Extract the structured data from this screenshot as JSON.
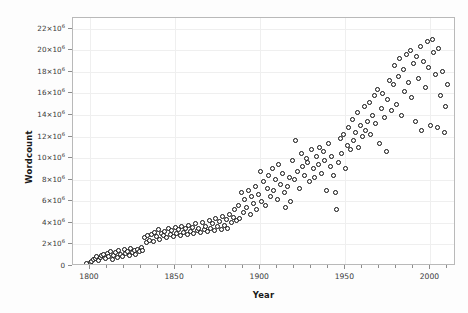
{
  "chart_data": {
    "type": "scatter",
    "title": "",
    "xlabel": "Year",
    "ylabel": "Wordcount",
    "xlim": [
      1790,
      2015
    ],
    "ylim": [
      0,
      23000000
    ],
    "grid": true,
    "legend": false,
    "marker": {
      "shape": "circle",
      "fill": "#ffffff",
      "stroke": "#0d0d0d",
      "size_px": 5
    },
    "xticks": [
      1800,
      1850,
      1900,
      1950,
      2000
    ],
    "xtick_labels": [
      "1800",
      "1850",
      "1900",
      "1950",
      "2000"
    ],
    "x_minor_tick_step": 10,
    "yticks": [
      0,
      2000000,
      4000000,
      6000000,
      8000000,
      10000000,
      12000000,
      14000000,
      16000000,
      18000000,
      20000000,
      22000000
    ],
    "ytick_labels": [
      "0",
      "2×10⁶",
      "4×10⁶",
      "6×10⁶",
      "8×10⁶",
      "10×10⁶",
      "12×10⁶",
      "14×10⁶",
      "16×10⁶",
      "18×10⁶",
      "20×10⁶",
      "22×10⁶"
    ],
    "ytick_mantissa": [
      "0",
      "2",
      "4",
      "6",
      "8",
      "10",
      "12",
      "14",
      "16",
      "18",
      "20",
      "22"
    ],
    "ytick_exponent": "6",
    "points": [
      [
        1798,
        250000
      ],
      [
        1800,
        300000
      ],
      [
        1801,
        450000
      ],
      [
        1802,
        600000
      ],
      [
        1803,
        700000
      ],
      [
        1804,
        900000
      ],
      [
        1805,
        500000
      ],
      [
        1806,
        800000
      ],
      [
        1807,
        1000000
      ],
      [
        1808,
        1100000
      ],
      [
        1809,
        700000
      ],
      [
        1810,
        1200000
      ],
      [
        1811,
        900000
      ],
      [
        1812,
        1300000
      ],
      [
        1813,
        600000
      ],
      [
        1814,
        1000000
      ],
      [
        1815,
        1250000
      ],
      [
        1816,
        800000
      ],
      [
        1817,
        1400000
      ],
      [
        1818,
        1050000
      ],
      [
        1819,
        900000
      ],
      [
        1820,
        1500000
      ],
      [
        1821,
        1200000
      ],
      [
        1822,
        1350000
      ],
      [
        1823,
        1000000
      ],
      [
        1824,
        1600000
      ],
      [
        1825,
        1250000
      ],
      [
        1826,
        1450000
      ],
      [
        1827,
        1100000
      ],
      [
        1828,
        1550000
      ],
      [
        1829,
        1300000
      ],
      [
        1830,
        1700000
      ],
      [
        1831,
        1400000
      ],
      [
        1832,
        2600000
      ],
      [
        1833,
        2200000
      ],
      [
        1834,
        2800000
      ],
      [
        1835,
        2400000
      ],
      [
        1836,
        2900000
      ],
      [
        1837,
        2300000
      ],
      [
        1838,
        3100000
      ],
      [
        1839,
        2700000
      ],
      [
        1840,
        3400000
      ],
      [
        1841,
        2500000
      ],
      [
        1842,
        3000000
      ],
      [
        1843,
        2800000
      ],
      [
        1844,
        3200000
      ],
      [
        1845,
        2600000
      ],
      [
        1846,
        3500000
      ],
      [
        1847,
        2900000
      ],
      [
        1848,
        3300000
      ],
      [
        1849,
        2700000
      ],
      [
        1850,
        3600000
      ],
      [
        1851,
        3000000
      ],
      [
        1852,
        3400000
      ],
      [
        1853,
        2800000
      ],
      [
        1854,
        3700000
      ],
      [
        1855,
        3100000
      ],
      [
        1856,
        3500000
      ],
      [
        1857,
        2900000
      ],
      [
        1858,
        3800000
      ],
      [
        1859,
        3200000
      ],
      [
        1860,
        3600000
      ],
      [
        1861,
        3000000
      ],
      [
        1862,
        3900000
      ],
      [
        1863,
        3300000
      ],
      [
        1864,
        3500000
      ],
      [
        1865,
        3100000
      ],
      [
        1866,
        4000000
      ],
      [
        1867,
        3400000
      ],
      [
        1868,
        3700000
      ],
      [
        1869,
        3200000
      ],
      [
        1870,
        4200000
      ],
      [
        1871,
        3500000
      ],
      [
        1872,
        3900000
      ],
      [
        1873,
        3300000
      ],
      [
        1874,
        4400000
      ],
      [
        1875,
        3700000
      ],
      [
        1876,
        4100000
      ],
      [
        1877,
        3400000
      ],
      [
        1878,
        4600000
      ],
      [
        1879,
        3800000
      ],
      [
        1880,
        4300000
      ],
      [
        1881,
        3500000
      ],
      [
        1882,
        4800000
      ],
      [
        1883,
        4000000
      ],
      [
        1884,
        4500000
      ],
      [
        1885,
        5200000
      ],
      [
        1886,
        4200000
      ],
      [
        1887,
        5600000
      ],
      [
        1888,
        4400000
      ],
      [
        1889,
        6800000
      ],
      [
        1890,
        5000000
      ],
      [
        1891,
        6200000
      ],
      [
        1892,
        5400000
      ],
      [
        1893,
        7000000
      ],
      [
        1894,
        4800000
      ],
      [
        1895,
        6400000
      ],
      [
        1896,
        5800000
      ],
      [
        1897,
        7400000
      ],
      [
        1898,
        5200000
      ],
      [
        1899,
        6600000
      ],
      [
        1900,
        8800000
      ],
      [
        1901,
        6000000
      ],
      [
        1902,
        7800000
      ],
      [
        1903,
        5600000
      ],
      [
        1904,
        7200000
      ],
      [
        1905,
        8400000
      ],
      [
        1906,
        6400000
      ],
      [
        1907,
        9000000
      ],
      [
        1908,
        7000000
      ],
      [
        1909,
        8000000
      ],
      [
        1910,
        6200000
      ],
      [
        1911,
        9400000
      ],
      [
        1912,
        7600000
      ],
      [
        1913,
        8600000
      ],
      [
        1914,
        6800000
      ],
      [
        1915,
        5400000
      ],
      [
        1916,
        7400000
      ],
      [
        1917,
        8200000
      ],
      [
        1918,
        6000000
      ],
      [
        1919,
        9800000
      ],
      [
        1920,
        8000000
      ],
      [
        1921,
        11600000
      ],
      [
        1922,
        8800000
      ],
      [
        1923,
        7200000
      ],
      [
        1924,
        10400000
      ],
      [
        1925,
        9200000
      ],
      [
        1926,
        8400000
      ],
      [
        1927,
        10000000
      ],
      [
        1928,
        9600000
      ],
      [
        1929,
        7800000
      ],
      [
        1930,
        10800000
      ],
      [
        1931,
        9000000
      ],
      [
        1932,
        8200000
      ],
      [
        1933,
        10200000
      ],
      [
        1934,
        9400000
      ],
      [
        1935,
        11000000
      ],
      [
        1936,
        8600000
      ],
      [
        1937,
        10600000
      ],
      [
        1938,
        9800000
      ],
      [
        1939,
        7000000
      ],
      [
        1940,
        11400000
      ],
      [
        1941,
        9200000
      ],
      [
        1942,
        10200000
      ],
      [
        1943,
        8400000
      ],
      [
        1944,
        6800000
      ],
      [
        1945,
        5200000
      ],
      [
        1946,
        9600000
      ],
      [
        1947,
        11800000
      ],
      [
        1948,
        10400000
      ],
      [
        1949,
        12200000
      ],
      [
        1950,
        9000000
      ],
      [
        1951,
        11200000
      ],
      [
        1952,
        12800000
      ],
      [
        1953,
        10800000
      ],
      [
        1954,
        13600000
      ],
      [
        1955,
        11600000
      ],
      [
        1956,
        12400000
      ],
      [
        1957,
        14200000
      ],
      [
        1958,
        11000000
      ],
      [
        1959,
        13000000
      ],
      [
        1960,
        12000000
      ],
      [
        1961,
        14800000
      ],
      [
        1962,
        12600000
      ],
      [
        1963,
        13400000
      ],
      [
        1964,
        15200000
      ],
      [
        1965,
        12200000
      ],
      [
        1966,
        14000000
      ],
      [
        1967,
        15800000
      ],
      [
        1968,
        13200000
      ],
      [
        1969,
        16400000
      ],
      [
        1970,
        11400000
      ],
      [
        1971,
        14600000
      ],
      [
        1972,
        16000000
      ],
      [
        1973,
        13800000
      ],
      [
        1974,
        10600000
      ],
      [
        1975,
        15400000
      ],
      [
        1976,
        17200000
      ],
      [
        1977,
        14400000
      ],
      [
        1978,
        16800000
      ],
      [
        1979,
        18600000
      ],
      [
        1980,
        15000000
      ],
      [
        1981,
        17600000
      ],
      [
        1982,
        19200000
      ],
      [
        1983,
        14000000
      ],
      [
        1984,
        18200000
      ],
      [
        1985,
        16200000
      ],
      [
        1986,
        19600000
      ],
      [
        1987,
        17000000
      ],
      [
        1988,
        20000000
      ],
      [
        1989,
        15600000
      ],
      [
        1990,
        18800000
      ],
      [
        1991,
        13400000
      ],
      [
        1992,
        19400000
      ],
      [
        1993,
        17400000
      ],
      [
        1994,
        20400000
      ],
      [
        1995,
        12600000
      ],
      [
        1996,
        19000000
      ],
      [
        1997,
        16600000
      ],
      [
        1998,
        20800000
      ],
      [
        1999,
        18400000
      ],
      [
        2000,
        13000000
      ],
      [
        2001,
        21000000
      ],
      [
        2002,
        19800000
      ],
      [
        2003,
        17800000
      ],
      [
        2004,
        12800000
      ],
      [
        2005,
        20200000
      ],
      [
        2006,
        15800000
      ],
      [
        2007,
        18000000
      ],
      [
        2008,
        12400000
      ],
      [
        2009,
        14800000
      ],
      [
        2010,
        16800000
      ]
    ]
  }
}
